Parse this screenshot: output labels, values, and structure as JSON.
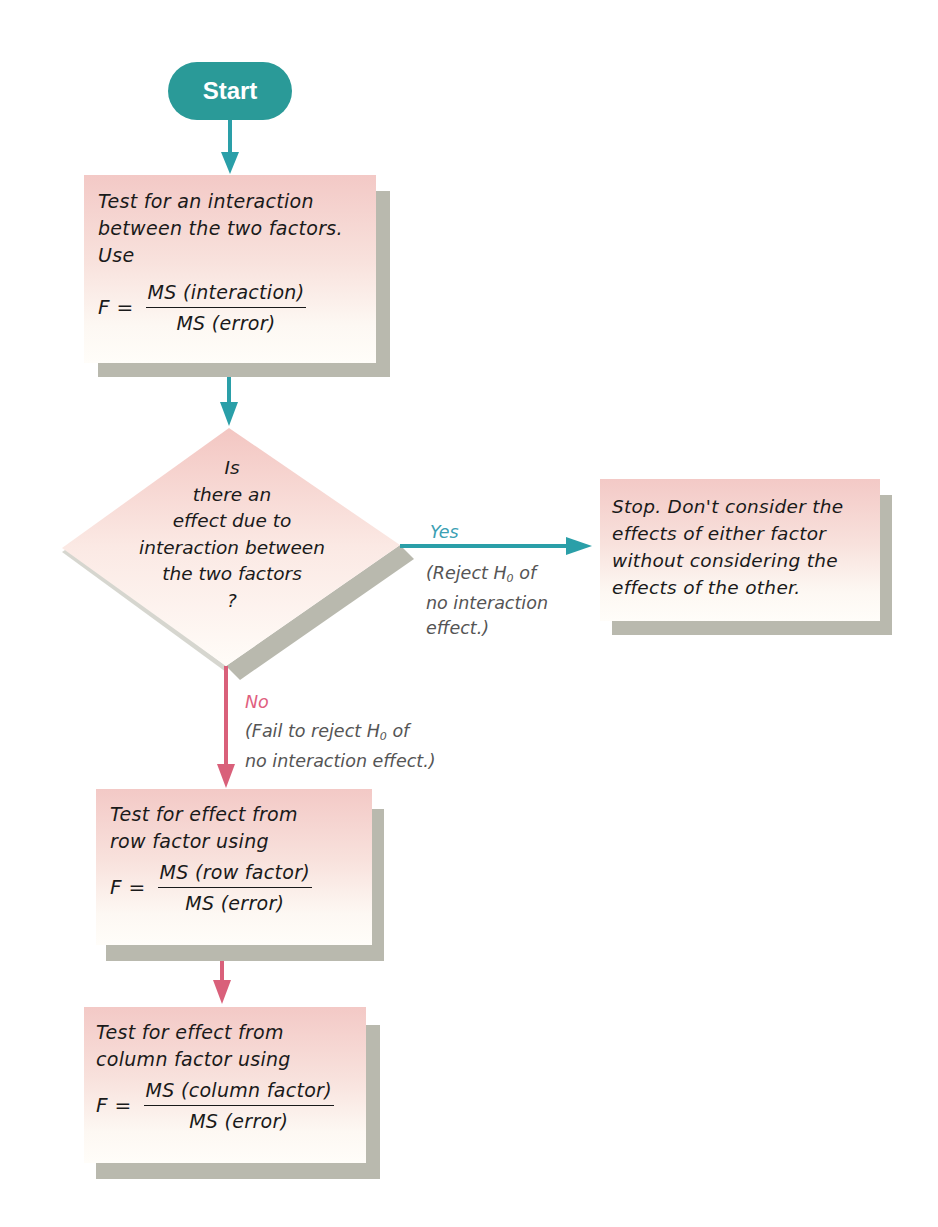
{
  "colors": {
    "teal": "#2a9a98",
    "teal_arrow": "#2a9fa8",
    "pink_arrow": "#d9607a",
    "box_top": "#f3c9c6",
    "box_bottom": "#fffdf9",
    "shadow": "#b9b9ae"
  },
  "start": {
    "label": "Start"
  },
  "box_interaction": {
    "line1_pre": "Test for an ",
    "line1_em": "interaction",
    "line2": "between the two factors.",
    "line3": "Use",
    "formula_lhs": "F =",
    "numerator": "MS (interaction)",
    "denominator": "MS (error)"
  },
  "decision": {
    "lines": [
      "Is",
      "there an",
      "effect due to",
      "interaction between",
      "the two factors",
      "?"
    ]
  },
  "yes_branch": {
    "label": "Yes",
    "note_line1_pre": "(Reject ",
    "note_h": "H",
    "note_sub": "0",
    "note_line1_post": " of",
    "note_line2": "no interaction",
    "note_line3": "effect.)"
  },
  "box_stop": {
    "lines": [
      "Stop. Don't consider the",
      "effects of either factor",
      "without considering the",
      "effects of the other."
    ]
  },
  "no_branch": {
    "label": "No",
    "note_line1_pre": "(Fail to reject ",
    "note_h": "H",
    "note_sub": "0",
    "note_line1_post": " of",
    "note_line2": "no interaction effect.)"
  },
  "box_row": {
    "line1": "Test for effect from",
    "line2": "row factor using",
    "formula_lhs": "F =",
    "numerator": "MS (row factor)",
    "denominator": "MS (error)"
  },
  "box_column": {
    "line1": "Test for effect from",
    "line2": "column factor using",
    "formula_lhs": "F =",
    "numerator": "MS (column factor)",
    "denominator": "MS (error)"
  }
}
